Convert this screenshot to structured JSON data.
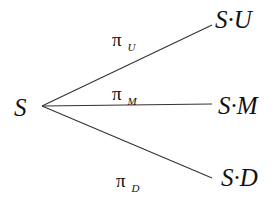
{
  "diagram": {
    "root": {
      "label": "S"
    },
    "branches": [
      {
        "node": "S·U",
        "prob_symbol": "π",
        "prob_sub": "U"
      },
      {
        "node": "S·M",
        "prob_symbol": "π",
        "prob_sub": "M"
      },
      {
        "node": "S·D",
        "prob_symbol": "π",
        "prob_sub": "D"
      }
    ],
    "line_color": "#333333"
  }
}
